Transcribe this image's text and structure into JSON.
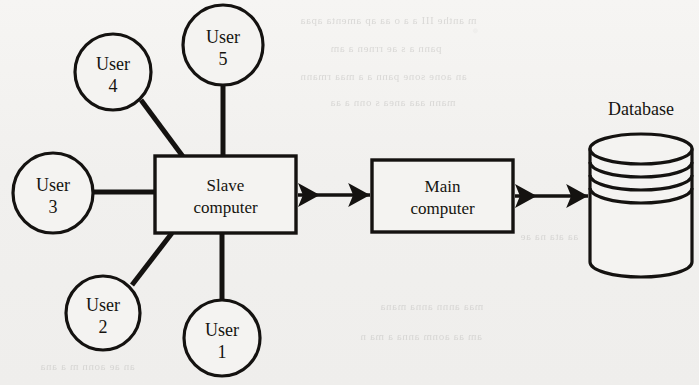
{
  "diagram": {
    "type": "node-link-diagram",
    "background_color": "#f2f1ef",
    "ink_color": "#141210",
    "nodes": [
      {
        "id": "user1",
        "name": "user-node-1",
        "shape": "circle",
        "line1": "User",
        "line2": "1",
        "cx": 222,
        "cy": 338,
        "r": 38
      },
      {
        "id": "user2",
        "name": "user-node-2",
        "shape": "circle",
        "line1": "User",
        "line2": "2",
        "cx": 103,
        "cy": 313,
        "r": 37
      },
      {
        "id": "user3",
        "name": "user-node-3",
        "shape": "circle",
        "line1": "User",
        "line2": "3",
        "cx": 53,
        "cy": 193,
        "r": 40
      },
      {
        "id": "user4",
        "name": "user-node-4",
        "shape": "circle",
        "line1": "User",
        "line2": "4",
        "cx": 113,
        "cy": 72,
        "r": 38
      },
      {
        "id": "user5",
        "name": "user-node-5",
        "shape": "circle",
        "line1": "User",
        "line2": "5",
        "cx": 223,
        "cy": 45,
        "r": 40
      },
      {
        "id": "slave",
        "name": "slave-computer-box",
        "shape": "rect",
        "line1": "Slave",
        "line2": "computer",
        "x": 155,
        "y": 156,
        "w": 141,
        "h": 77
      },
      {
        "id": "main",
        "name": "main-computer-box",
        "shape": "rect",
        "line1": "Main",
        "line2": "computer",
        "x": 372,
        "y": 160,
        "w": 141,
        "h": 72
      },
      {
        "id": "database",
        "name": "database-cylinder",
        "shape": "cylinder",
        "label": "Database",
        "x": 590,
        "y": 134,
        "w": 102,
        "h": 143,
        "label_x": 641,
        "label_y": 115,
        "platter_lines": 3
      }
    ],
    "links": [
      {
        "name": "link-user5-slave",
        "from": "user5",
        "to": "slave",
        "kind": "plain-line",
        "x1": 223,
        "y1": 85,
        "x2": 223,
        "y2": 157
      },
      {
        "name": "link-user4-slave",
        "from": "user4",
        "to": "slave",
        "kind": "plain-line",
        "x1": 141,
        "y1": 100,
        "x2": 184,
        "y2": 158
      },
      {
        "name": "link-user3-slave",
        "from": "user3",
        "to": "slave",
        "kind": "plain-line",
        "x1": 93,
        "y1": 192,
        "x2": 156,
        "y2": 192
      },
      {
        "name": "link-user2-slave",
        "from": "user2",
        "to": "slave",
        "kind": "plain-line",
        "x1": 132,
        "y1": 285,
        "x2": 172,
        "y2": 233
      },
      {
        "name": "link-user1-slave",
        "from": "user1",
        "to": "slave",
        "kind": "plain-line",
        "x1": 222,
        "y1": 300,
        "x2": 222,
        "y2": 233
      },
      {
        "name": "link-slave-main",
        "from": "slave",
        "to": "main",
        "kind": "double-arrow",
        "x1": 298,
        "y1": 195,
        "x2": 370,
        "y2": 195
      },
      {
        "name": "link-main-database",
        "from": "main",
        "to": "database",
        "kind": "double-arrow",
        "x1": 515,
        "y1": 196,
        "x2": 588,
        "y2": 196
      }
    ]
  },
  "ghost_marks": [
    {
      "text": "m  anthe  III  a  a  o  aa  ap  amenta  apaa",
      "x": 300,
      "y": 14
    },
    {
      "text": "pann  a  s  ae  rrnen  a  am",
      "x": 330,
      "y": 42
    },
    {
      "text": "an  aone  sone  pann  a  a  maa  rmann",
      "x": 300,
      "y": 70
    },
    {
      "text": "mann  aaa  anea  s  onn  a  aa",
      "x": 330,
      "y": 96
    },
    {
      "text": "aa  ata  na  ae",
      "x": 520,
      "y": 230
    },
    {
      "text": "maa  annn  anna  mana",
      "x": 380,
      "y": 300
    },
    {
      "text": "am  aa  aonm  anna  a  ma  n",
      "x": 360,
      "y": 330
    },
    {
      "text": "an  ae  aonn  m  a  ana",
      "x": 40,
      "y": 360
    }
  ]
}
